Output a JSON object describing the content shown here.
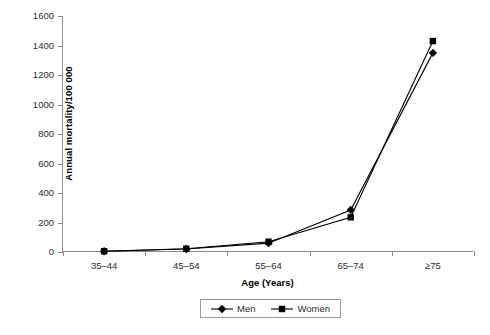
{
  "chart_data": {
    "type": "line",
    "title": "",
    "xlabel": "Age (Years)",
    "ylabel": "Annual mortality/100 000",
    "categories": [
      "35–44",
      "45–54",
      "55–64",
      "65–74",
      "≥75"
    ],
    "yticks": [
      0,
      200,
      400,
      600,
      800,
      1000,
      1200,
      1400,
      1600
    ],
    "ytick_labels": [
      "0",
      "200",
      "400",
      "600",
      "800",
      "1000",
      "1200",
      "1400",
      "1600"
    ],
    "ylim": [
      0,
      1600
    ],
    "grid": false,
    "legend_position": "bottom-center",
    "series": [
      {
        "name": "Men",
        "marker": "diamond",
        "color": "#000000",
        "values": [
          5,
          20,
          60,
          285,
          1350
        ]
      },
      {
        "name": "Women",
        "marker": "square",
        "color": "#000000",
        "values": [
          5,
          22,
          70,
          235,
          1430
        ]
      }
    ]
  },
  "legend": {
    "entries": [
      {
        "label": "Men",
        "marker": "diamond"
      },
      {
        "label": "Women",
        "marker": "square"
      }
    ]
  }
}
